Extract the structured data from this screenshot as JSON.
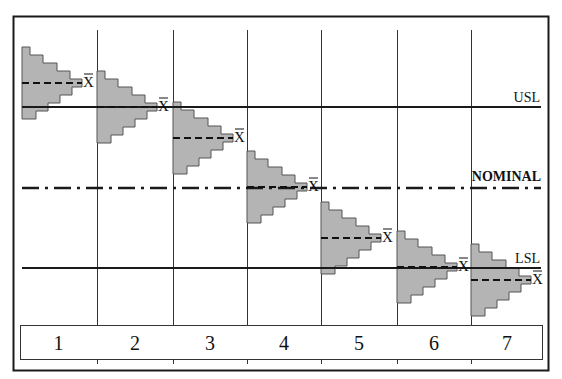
{
  "diagram": {
    "colors": {
      "line": "#1a1a1a",
      "grid": "#333333",
      "histogram_fill": "#b4b4b4",
      "histogram_stroke": "#555555",
      "background": "#ffffff"
    },
    "limits": {
      "usl": {
        "label": "USL",
        "y": 107
      },
      "nominal": {
        "label": "NOMINAL",
        "y": 188
      },
      "lsl": {
        "label": "LSL",
        "y": 268
      }
    },
    "mean_symbol": "X̄",
    "bin_widths": [
      8,
      21,
      35,
      48,
      60,
      50,
      38,
      26,
      14
    ],
    "bin_height": 8,
    "samples": [
      {
        "label": "1",
        "x": 22,
        "top": 47
      },
      {
        "label": "2",
        "x": 97,
        "top": 71
      },
      {
        "label": "3",
        "x": 173,
        "top": 102
      },
      {
        "label": "4",
        "x": 247,
        "top": 151
      },
      {
        "label": "5",
        "x": 321,
        "top": 202
      },
      {
        "label": "6",
        "x": 397,
        "top": 231
      },
      {
        "label": "7",
        "x": 471,
        "top": 244
      }
    ]
  }
}
